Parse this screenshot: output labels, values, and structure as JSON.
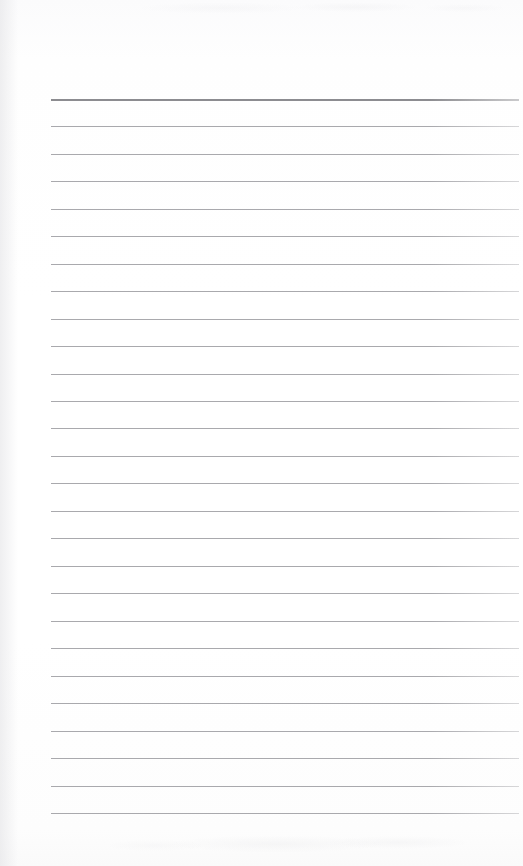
{
  "document": {
    "kind": "scanned-lined-notepad-page",
    "title": "",
    "body_text": "",
    "page_width": 523,
    "page_height": 866,
    "background_color": "#fdfdfd"
  },
  "ruling": {
    "line_color": "#a9a9ad",
    "header_line_color": "#8c8c90",
    "line_count": 27,
    "first_line_y": 99,
    "line_spacing": 27.5,
    "left_x": 51,
    "right_x": 519,
    "header_line_index": 0,
    "lines": [
      {
        "index": 1,
        "y": 99,
        "weight": "heavy"
      },
      {
        "index": 2,
        "y": 126,
        "weight": "light"
      },
      {
        "index": 3,
        "y": 154,
        "weight": "light"
      },
      {
        "index": 4,
        "y": 181,
        "weight": "light"
      },
      {
        "index": 5,
        "y": 209,
        "weight": "light"
      },
      {
        "index": 6,
        "y": 236,
        "weight": "light"
      },
      {
        "index": 7,
        "y": 264,
        "weight": "light"
      },
      {
        "index": 8,
        "y": 291,
        "weight": "light"
      },
      {
        "index": 9,
        "y": 319,
        "weight": "light"
      },
      {
        "index": 10,
        "y": 346,
        "weight": "light"
      },
      {
        "index": 11,
        "y": 374,
        "weight": "light"
      },
      {
        "index": 12,
        "y": 401,
        "weight": "light"
      },
      {
        "index": 13,
        "y": 428,
        "weight": "light"
      },
      {
        "index": 14,
        "y": 456,
        "weight": "light"
      },
      {
        "index": 15,
        "y": 483,
        "weight": "light"
      },
      {
        "index": 16,
        "y": 511,
        "weight": "light"
      },
      {
        "index": 17,
        "y": 538,
        "weight": "light"
      },
      {
        "index": 18,
        "y": 566,
        "weight": "light"
      },
      {
        "index": 19,
        "y": 593,
        "weight": "light"
      },
      {
        "index": 20,
        "y": 621,
        "weight": "light"
      },
      {
        "index": 21,
        "y": 648,
        "weight": "light"
      },
      {
        "index": 22,
        "y": 676,
        "weight": "light"
      },
      {
        "index": 23,
        "y": 703,
        "weight": "light"
      },
      {
        "index": 24,
        "y": 731,
        "weight": "light"
      },
      {
        "index": 25,
        "y": 758,
        "weight": "light"
      },
      {
        "index": 26,
        "y": 786,
        "weight": "light"
      },
      {
        "index": 27,
        "y": 813,
        "weight": "light"
      }
    ]
  },
  "margins": {
    "top_blank_height": 99,
    "bottom_blank_height": 53,
    "left_blank_width": 51,
    "right_blank_width": 4
  }
}
